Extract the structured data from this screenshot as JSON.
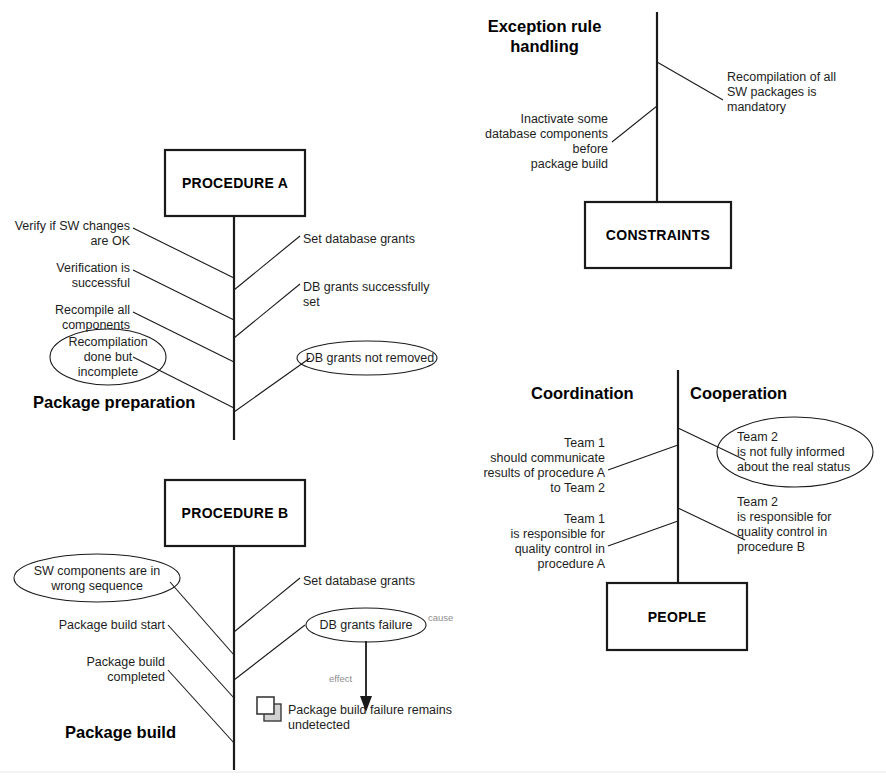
{
  "diagram": {
    "type": "fishbone-cause-effect",
    "sections": [
      {
        "id": "package-preparation",
        "title": "Package preparation",
        "head_box": "PROCEDURE\nA",
        "left_branches": [
          "Verify if SW changes\nare OK",
          "Verification is\nsuccessful",
          "Recompile all\ncomponents",
          "Recompilation\ndone but\nincomplete"
        ],
        "right_branches": [
          "Set database grants",
          "DB grants successfully\nset",
          "DB grants not removed"
        ],
        "ellipse_labels": [
          "Recompilation\ndone but\nincomplete",
          "DB grants not removed"
        ]
      },
      {
        "id": "package-build",
        "title": "Package build",
        "head_box": "PROCEDURE\nB",
        "left_branches": [
          "SW components are in\nwrong sequence",
          "Package build start",
          "Package build\ncompleted"
        ],
        "right_branches": [
          "Set database grants",
          "DB grants failure"
        ],
        "ellipse_labels": [
          "SW components are in\nwrong sequence",
          "DB grants failure"
        ],
        "cause_label": "cause",
        "effect_label": "effect",
        "effect_text": "Package build failure remains\nundetected",
        "effect_icon": "copy-squares-icon"
      },
      {
        "id": "exception-rule-handling",
        "title": "Exception rule\nhandling",
        "head_box": "CONSTRAINTS",
        "left_branches": [
          "Inactivate some\ndatabase components\nbefore\npackage build"
        ],
        "right_branches": [
          "Recompilation of all\nSW packages is\nmandatory"
        ],
        "ellipse_labels": []
      },
      {
        "id": "coordination-cooperation",
        "title_left": "Coordination",
        "title_right": "Cooperation",
        "head_box": "PEOPLE",
        "left_branches": [
          "Team 1\nshould communicate\nresults of procedure A\nto Team 2",
          "Team 1\nis responsible for\nquality control in\nprocedure A"
        ],
        "right_branches": [
          "Team 2\nis not fully informed\nabout the real status",
          "Team 2\nis responsible for\nquality control in\nprocedure B"
        ],
        "ellipse_labels": [
          "Team 2\nis not fully informed\nabout the real status"
        ]
      }
    ]
  },
  "colors": {
    "line": "#1a1a1a",
    "text": "#1d1d1d",
    "muted": "#8e8e8e",
    "icon_fill": "#d9d9d9",
    "background": "#ffffff"
  }
}
